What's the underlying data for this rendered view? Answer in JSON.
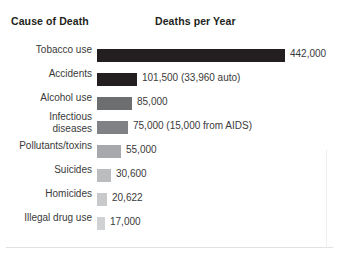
{
  "header": {
    "cause_label": "Cause of Death",
    "deaths_label": "Deaths per Year"
  },
  "chart_data": {
    "type": "bar",
    "orientation": "horizontal",
    "title": "",
    "xlabel": "Deaths per Year",
    "ylabel": "Cause of Death",
    "grid": false,
    "legend": false,
    "xlim": [
      0,
      442000
    ],
    "categories": [
      "Tobacco use",
      "Accidents",
      "Alcohol use",
      "Infectious\ndiseases",
      "Pollutants/toxins",
      "Suicides",
      "Homicides",
      "Illegal drug use"
    ],
    "values": [
      442000,
      101500,
      85000,
      75000,
      55000,
      30600,
      20622,
      17000
    ],
    "value_labels": [
      "442,000",
      "101,500 (33,960 auto)",
      "85,000",
      "75,000 (15,000 from AIDS)",
      "55,000",
      "30,600",
      "20,622",
      "17,000"
    ],
    "bar_colors": [
      "#231f20",
      "#231f20",
      "#6d6e70",
      "#808184",
      "#a6a8ab",
      "#babcbe",
      "#c7c9cb",
      "#cfd1d2"
    ],
    "bar_pixel_widths": [
      188,
      40,
      35,
      31,
      24,
      14,
      10,
      8
    ]
  }
}
